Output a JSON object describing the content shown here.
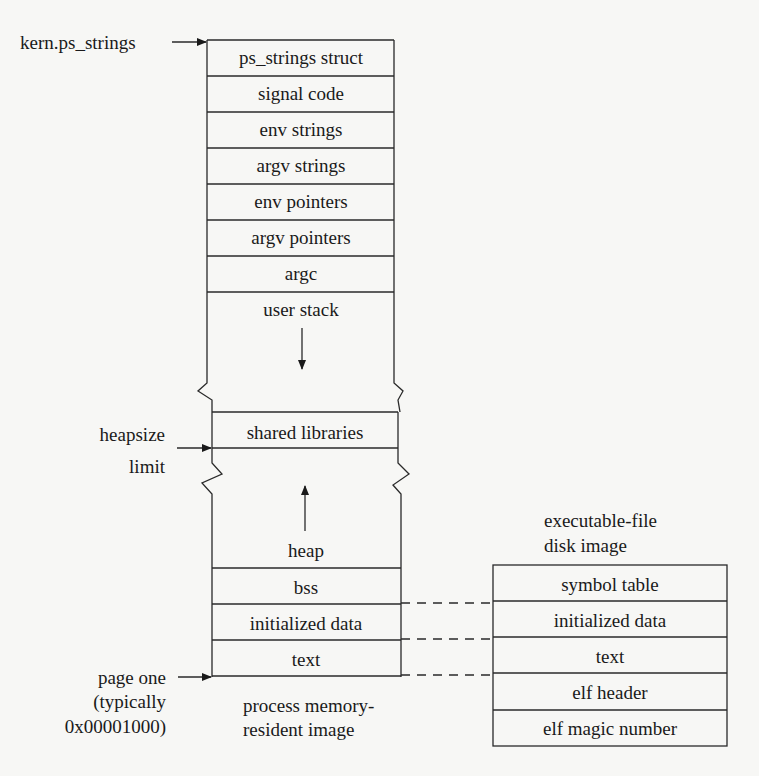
{
  "diagram": {
    "memory_image": {
      "caption": [
        "process memory-",
        "resident image"
      ],
      "top_rows": [
        "ps_strings struct",
        "signal code",
        "env strings",
        "argv strings",
        "env pointers",
        "argv pointers",
        "argc",
        "user stack"
      ],
      "middle_row": "shared libraries",
      "bottom_rows": [
        "heap",
        "bss",
        "initialized data",
        "text"
      ]
    },
    "disk_image": {
      "caption": [
        "executable-file",
        "disk image"
      ],
      "rows": [
        "symbol table",
        "initialized data",
        "text",
        "elf header",
        "elf magic number"
      ]
    },
    "pointers": {
      "kern_ps_strings": "kern.ps_strings",
      "heapsize_limit": [
        "heapsize",
        "limit"
      ],
      "page_one": [
        "page one",
        "(typically",
        "0x00001000)"
      ]
    }
  }
}
